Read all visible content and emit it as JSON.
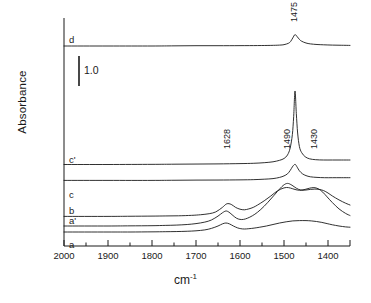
{
  "axes": {
    "ylabel": "Absorbance",
    "xlabel_main": "cm",
    "xlabel_sup": "-1",
    "xticks": [
      "2000",
      "1900",
      "1800",
      "1700",
      "1600",
      "1500",
      "1400"
    ],
    "xtick_values": [
      2000,
      1900,
      1800,
      1700,
      1600,
      1500,
      1400
    ],
    "xlim": [
      2000,
      1350
    ],
    "minor_tick_step": 50
  },
  "scalebar": {
    "label": "1.0",
    "value": 1.0,
    "units": "absorbance"
  },
  "trace_labels": [
    "d",
    "c'",
    "c",
    "b",
    "a'",
    "a"
  ],
  "peak_labels": [
    "1475",
    "1628",
    "1490",
    "1430"
  ],
  "colors": {
    "line": "#1a1a1a",
    "background": "#ffffff",
    "text": "#1a1a1a"
  },
  "chart_data": {
    "type": "line",
    "title": "",
    "subtitle": "",
    "xlabel": "cm-1",
    "ylabel": "Absorbance",
    "xlim": [
      2000,
      1350
    ],
    "xticks": [
      2000,
      1900,
      1800,
      1700,
      1600,
      1500,
      1400
    ],
    "minor_xticks": [
      1950,
      1850,
      1750,
      1650,
      1550,
      1450,
      1400,
      1350
    ],
    "ylim": [
      0,
      7.6
    ],
    "grid": false,
    "legend": "inline-left-labels",
    "scalebar_value": 1.0,
    "annotations": [
      {
        "text": "1475",
        "x": 1475,
        "series": "d",
        "rotation": 90
      },
      {
        "text": "1628",
        "x": 1628,
        "series": "b",
        "rotation": 90
      },
      {
        "text": "1490",
        "x": 1490,
        "series": "b",
        "rotation": 90
      },
      {
        "text": "1430",
        "x": 1430,
        "series": "b",
        "rotation": 90
      }
    ],
    "series": [
      {
        "name": "d",
        "label": "d",
        "offset": 6.2,
        "peaks": [
          {
            "center": 1475,
            "height": 0.38,
            "width": 24
          }
        ],
        "points_x": [
          2000,
          1900,
          1800,
          1750,
          1700,
          1650,
          1600,
          1560,
          1530,
          1510,
          1500,
          1490,
          1485,
          1480,
          1475,
          1470,
          1465,
          1460,
          1450,
          1440,
          1425,
          1410,
          1390,
          1370,
          1350
        ],
        "points_y": [
          0.0,
          0.0,
          0.0,
          0.005,
          0.01,
          0.01,
          0.012,
          0.015,
          0.02,
          0.03,
          0.045,
          0.09,
          0.15,
          0.27,
          0.38,
          0.31,
          0.22,
          0.16,
          0.1,
          0.07,
          0.05,
          0.04,
          0.03,
          0.025,
          0.02
        ]
      },
      {
        "name": "c'",
        "label": "c'",
        "offset": 2.25,
        "peaks": [
          {
            "center": 1475,
            "height": 2.45,
            "width": 9
          }
        ],
        "points_x": [
          2000,
          1900,
          1800,
          1750,
          1700,
          1650,
          1600,
          1570,
          1545,
          1525,
          1510,
          1500,
          1492,
          1486,
          1481,
          1478,
          1475,
          1472,
          1469,
          1465,
          1460,
          1452,
          1442,
          1428,
          1410,
          1390,
          1370,
          1350
        ],
        "points_y": [
          0.0,
          0.0,
          0.005,
          0.01,
          0.015,
          0.02,
          0.03,
          0.04,
          0.06,
          0.09,
          0.14,
          0.2,
          0.32,
          0.55,
          1.0,
          1.6,
          2.45,
          1.7,
          1.05,
          0.6,
          0.4,
          0.26,
          0.19,
          0.16,
          0.15,
          0.15,
          0.15,
          0.15
        ]
      },
      {
        "name": "c",
        "label": "c",
        "offset": 1.72,
        "peaks": [
          {
            "center": 1475,
            "height": 0.53,
            "width": 13
          }
        ],
        "points_x": [
          2000,
          1900,
          1800,
          1750,
          1700,
          1650,
          1600,
          1570,
          1545,
          1525,
          1510,
          1500,
          1492,
          1486,
          1481,
          1477,
          1474,
          1470,
          1465,
          1458,
          1450,
          1440,
          1425,
          1408,
          1390,
          1370,
          1350
        ],
        "points_y": [
          0.0,
          0.0,
          0.0,
          0.005,
          0.01,
          0.012,
          0.018,
          0.025,
          0.04,
          0.06,
          0.1,
          0.15,
          0.22,
          0.33,
          0.45,
          0.52,
          0.53,
          0.44,
          0.32,
          0.22,
          0.16,
          0.12,
          0.1,
          0.09,
          0.09,
          0.09,
          0.09
        ]
      },
      {
        "name": "b",
        "label": "b",
        "offset": 0.52,
        "peaks": [
          {
            "center": 1628,
            "height": 0.42,
            "width": 22
          },
          {
            "center": 1490,
            "height": 0.95,
            "width": 42
          },
          {
            "center": 1430,
            "height": 0.88,
            "width": 40
          }
        ],
        "points_x": [
          2000,
          1900,
          1850,
          1800,
          1770,
          1740,
          1710,
          1690,
          1670,
          1655,
          1640,
          1630,
          1620,
          1610,
          1600,
          1590,
          1580,
          1570,
          1560,
          1545,
          1530,
          1515,
          1500,
          1490,
          1480,
          1470,
          1460,
          1450,
          1440,
          1430,
          1420,
          1410,
          1400,
          1390,
          1375,
          1360,
          1350
        ],
        "points_y": [
          0.0,
          0.0,
          0.005,
          0.01,
          0.015,
          0.02,
          0.035,
          0.055,
          0.09,
          0.15,
          0.3,
          0.42,
          0.4,
          0.3,
          0.24,
          0.22,
          0.25,
          0.3,
          0.38,
          0.52,
          0.68,
          0.85,
          0.95,
          0.96,
          0.92,
          0.88,
          0.87,
          0.88,
          0.9,
          0.91,
          0.9,
          0.86,
          0.78,
          0.68,
          0.55,
          0.44,
          0.38
        ]
      },
      {
        "name": "a'",
        "label": "a'",
        "offset": 0.2,
        "peaks": [
          {
            "center": 1628,
            "height": 0.5,
            "width": 20
          },
          {
            "center": 1490,
            "height": 1.42,
            "width": 38
          },
          {
            "center": 1430,
            "height": 1.28,
            "width": 38
          }
        ],
        "points_x": [
          2000,
          1900,
          1850,
          1800,
          1770,
          1745,
          1720,
          1700,
          1680,
          1665,
          1650,
          1640,
          1632,
          1625,
          1616,
          1608,
          1600,
          1592,
          1583,
          1572,
          1560,
          1545,
          1530,
          1515,
          1502,
          1492,
          1482,
          1472,
          1462,
          1452,
          1442,
          1432,
          1422,
          1412,
          1402,
          1390,
          1375,
          1360,
          1350
        ],
        "points_y": [
          0.0,
          0.0,
          0.005,
          0.01,
          0.02,
          0.03,
          0.05,
          0.08,
          0.13,
          0.2,
          0.33,
          0.44,
          0.5,
          0.46,
          0.35,
          0.26,
          0.22,
          0.22,
          0.26,
          0.34,
          0.46,
          0.66,
          0.9,
          1.15,
          1.35,
          1.42,
          1.36,
          1.26,
          1.2,
          1.22,
          1.26,
          1.28,
          1.24,
          1.13,
          0.97,
          0.78,
          0.57,
          0.42,
          0.35
        ]
      },
      {
        "name": "a",
        "label": "a",
        "offset": 0.0,
        "peaks": [
          {
            "center": 1628,
            "height": 0.3,
            "width": 20
          },
          {
            "center": 1450,
            "height": 0.38,
            "width": 52
          }
        ],
        "points_x": [
          2000,
          1900,
          1850,
          1800,
          1770,
          1745,
          1720,
          1700,
          1680,
          1665,
          1650,
          1640,
          1632,
          1624,
          1615,
          1606,
          1598,
          1590,
          1580,
          1568,
          1555,
          1540,
          1525,
          1510,
          1495,
          1480,
          1465,
          1450,
          1438,
          1426,
          1414,
          1402,
          1390,
          1375,
          1360,
          1350
        ],
        "points_y": [
          0.0,
          0.0,
          0.0,
          0.005,
          0.01,
          0.015,
          0.025,
          0.04,
          0.07,
          0.12,
          0.2,
          0.27,
          0.3,
          0.27,
          0.2,
          0.14,
          0.11,
          0.1,
          0.11,
          0.13,
          0.16,
          0.2,
          0.25,
          0.3,
          0.34,
          0.37,
          0.38,
          0.38,
          0.37,
          0.35,
          0.32,
          0.28,
          0.24,
          0.2,
          0.17,
          0.16
        ]
      }
    ]
  }
}
